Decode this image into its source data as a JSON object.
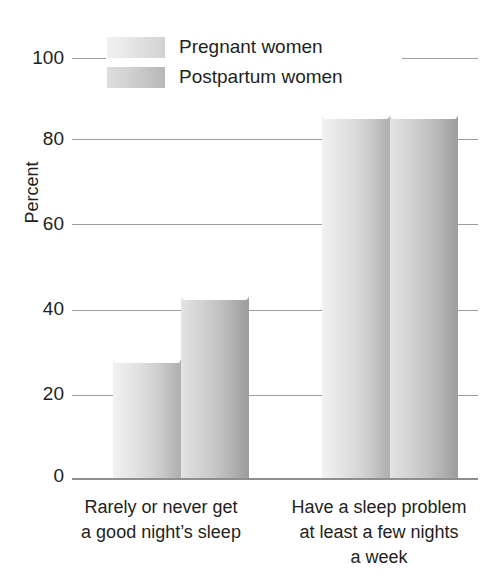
{
  "chart_data": {
    "type": "bar",
    "title": "",
    "xlabel": "",
    "ylabel": "Percent",
    "ylim": [
      0,
      100
    ],
    "ytick_labels": [
      "100",
      "80",
      "60",
      "40",
      "20",
      "0"
    ],
    "yticks": [
      100,
      80,
      60,
      40,
      20,
      0
    ],
    "grid": true,
    "legend_position": "top-left",
    "categories": [
      "Rarely or never get a good night’s sleep",
      "Have a sleep problem at least a few nights a week"
    ],
    "category_lines": [
      [
        "Rarely or never get",
        "a good night’s sleep"
      ],
      [
        "Have a sleep problem",
        "at least a few nights",
        "a week"
      ]
    ],
    "series": [
      {
        "name": "Pregnant women",
        "values": [
          30,
          88
        ],
        "color": "#e2e2e2"
      },
      {
        "name": "Postpartum women",
        "values": [
          45,
          88
        ],
        "color": "#c6c6c6"
      }
    ]
  },
  "legend": {
    "items": [
      {
        "label": "Pregnant women"
      },
      {
        "label": "Postpartum women"
      }
    ]
  },
  "axis": {
    "y_title": "Percent"
  }
}
